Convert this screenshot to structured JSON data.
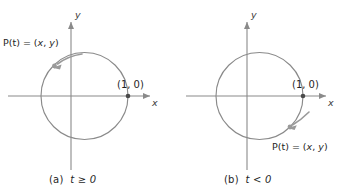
{
  "figure": {
    "background_color": "#ffffff",
    "stroke_color": "#8a8a8a",
    "accent_color": "#9a9a9a",
    "text_color": "#1f1f1f",
    "panels": [
      {
        "id": "panel-a",
        "caption": "(a)  t ≥ 0",
        "caption_label": "(a)",
        "caption_condition": "t ≥ 0",
        "direction": "counterclockwise",
        "axis_x_label": "x",
        "axis_y_label": "y",
        "intercept_label": "(1, 0)",
        "point_label": "P(t) = (x, y)",
        "point_label_prefix": "P(t) = (",
        "point_label_x": "x",
        "point_label_sep": ", ",
        "point_label_y": "y",
        "point_label_suffix": ")",
        "circle": {
          "cx": 84.5,
          "cy": 96,
          "r": 43.5
        },
        "origin": {
          "x": 71,
          "y": 96
        },
        "intercept_point": {
          "x": 128,
          "y": 96
        },
        "moving_point": {
          "x": 52,
          "y": 65
        }
      },
      {
        "id": "panel-b",
        "caption": "(b)  t < 0",
        "caption_label": "(b)",
        "caption_condition": "t < 0",
        "direction": "clockwise",
        "axis_x_label": "x",
        "axis_y_label": "y",
        "intercept_label": "(1, 0)",
        "point_label": "P(t) = (x, y)",
        "point_label_prefix": "P(t) = (",
        "point_label_x": "x",
        "point_label_sep": ", ",
        "point_label_y": "y",
        "point_label_suffix": ")",
        "circle": {
          "cx": 259.5,
          "cy": 96,
          "r": 43.5
        },
        "origin": {
          "x": 247,
          "y": 96
        },
        "intercept_point": {
          "x": 303,
          "y": 96
        },
        "moving_point": {
          "x": 288,
          "y": 128
        }
      }
    ]
  }
}
